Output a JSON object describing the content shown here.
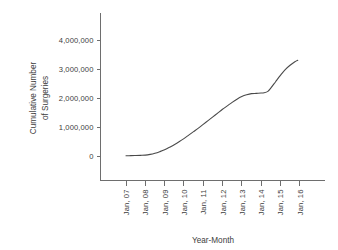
{
  "chart_data": {
    "type": "line",
    "title": "",
    "subtitle": "",
    "xlabel": "Year-Month",
    "ylabel": "Cumulative Number of Surgeries",
    "ylabel_line1": "Cumulative Number",
    "ylabel_line2": "of Surgeries",
    "grid": false,
    "legend": null,
    "legend_position": "none",
    "line_color": "#4a4a4a",
    "axis_color": "#6e6e6e",
    "text_color": "#3d3d3d",
    "background_color": "#ffffff",
    "xlim": [
      2007.0,
      2016.0
    ],
    "ylim": [
      0,
      4500000
    ],
    "ytick_values": [
      0,
      1000000,
      2000000,
      3000000,
      4000000
    ],
    "ytick_labels": [
      "0",
      "1,000,000",
      "2,000,000",
      "3,000,000",
      "4,000,000"
    ],
    "xtick_labels": [
      "Jan, 07",
      "Jan, 08",
      "Jan, 09",
      "Jan, 10",
      "Jan, 11",
      "Jan, 12",
      "Jan, 13",
      "Jan, 14",
      "Jan, 15",
      "Jan, 16"
    ],
    "xtick_values": [
      2007,
      2008,
      2009,
      2010,
      2011,
      2012,
      2013,
      2014,
      2015,
      2016
    ],
    "series": [
      {
        "name": "Cumulative Number of Surgeries",
        "x": [
          2007.0,
          2007.25,
          2007.5,
          2007.75,
          2008.0,
          2008.25,
          2008.5,
          2008.75,
          2009.0,
          2009.25,
          2009.5,
          2009.75,
          2010.0,
          2010.25,
          2010.5,
          2010.75,
          2011.0,
          2011.25,
          2011.5,
          2011.75,
          2012.0,
          2012.25,
          2012.5,
          2012.75,
          2013.0,
          2013.25,
          2013.5,
          2013.75,
          2014.0,
          2014.15,
          2014.35,
          2014.5,
          2014.75,
          2015.0,
          2015.25,
          2015.5,
          2015.75,
          2015.9
        ],
        "values": [
          10000,
          12000,
          16000,
          22000,
          30000,
          55000,
          95000,
          150000,
          215000,
          300000,
          390000,
          490000,
          600000,
          720000,
          840000,
          960000,
          1090000,
          1220000,
          1350000,
          1480000,
          1610000,
          1730000,
          1850000,
          1960000,
          2050000,
          2110000,
          2150000,
          2160000,
          2170000,
          2180000,
          2230000,
          2340000,
          2560000,
          2780000,
          2980000,
          3130000,
          3250000,
          3300000
        ]
      }
    ],
    "annotations": [
      {
        "text": "plateau near 2,150,000 around Jan, 14",
        "x": 2014.0,
        "y": 2150000
      }
    ],
    "final_value": 3300000,
    "start_value": 10000
  }
}
